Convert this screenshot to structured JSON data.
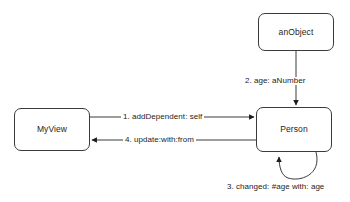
{
  "diagram": {
    "background_color": "#ffffff",
    "stroke_color": "#3a3a3a",
    "text_color": "#1d1d1d",
    "nodes": [
      {
        "id": "myview",
        "label": "MyView"
      },
      {
        "id": "person",
        "label": "Person"
      },
      {
        "id": "anobject",
        "label": "anObject"
      }
    ],
    "messages": [
      {
        "seq": "1",
        "label": "1. addDependent: self",
        "from": "MyView",
        "to": "Person"
      },
      {
        "seq": "2",
        "label": "2. age: aNumber",
        "from": "anObject",
        "to": "Person"
      },
      {
        "seq": "3",
        "label": "3. changed: #age with: age",
        "from": "Person",
        "to": "Person"
      },
      {
        "seq": "4",
        "label": "4. update:with:from",
        "from": "Person",
        "to": "MyView"
      }
    ]
  }
}
